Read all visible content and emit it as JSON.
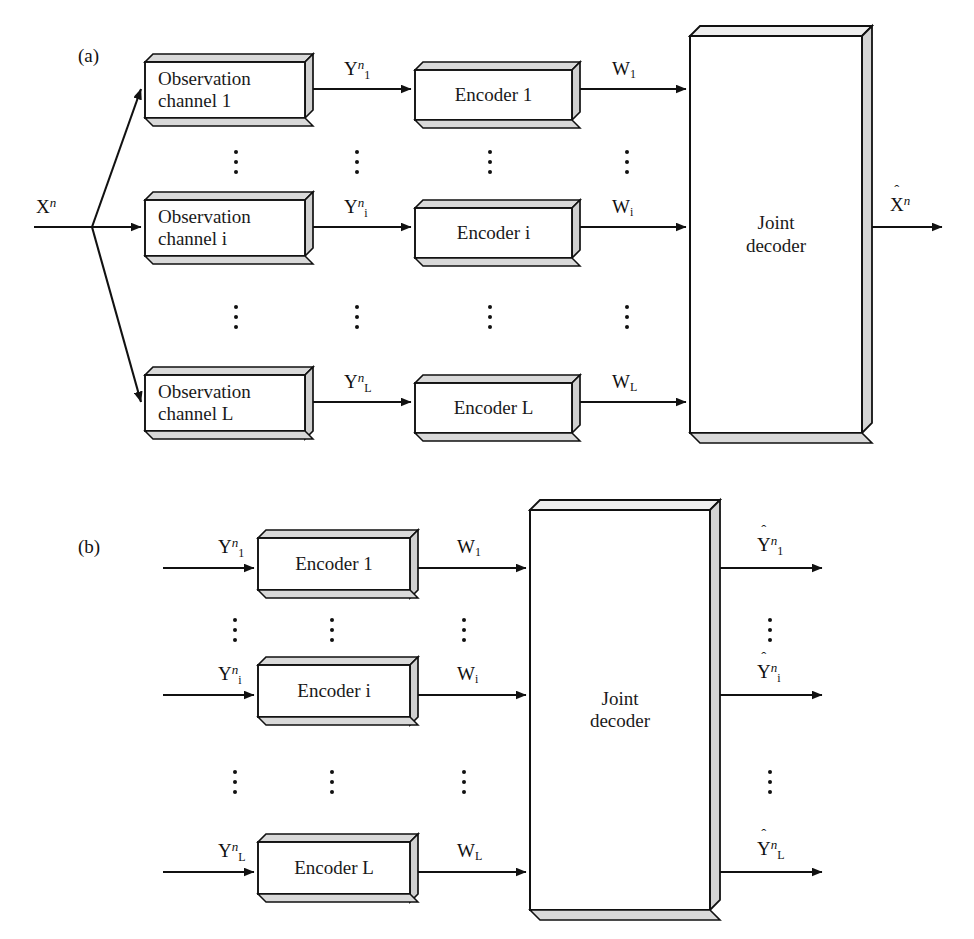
{
  "figure": {
    "background": "#ffffff",
    "line_color": "#111111",
    "box_fill": "#ffffff",
    "box_shadow_fill": "#d9d9d9"
  },
  "panels": [
    {
      "tag": "(a)",
      "input_label": "X",
      "input_sup": "n",
      "blocks_col1": [
        {
          "line1": "Observation",
          "line2": "channel 1"
        },
        {
          "line1": "Observation",
          "line2": "channel i"
        },
        {
          "line1": "Observation",
          "line2": "channel L"
        }
      ],
      "mid_labels": [
        {
          "base": "Y",
          "sub": "1",
          "sup": "n"
        },
        {
          "base": "Y",
          "sub": "i",
          "sup": "n"
        },
        {
          "base": "Y",
          "sub": "L",
          "sup": "n"
        }
      ],
      "blocks_col2": [
        {
          "line1": "Encoder 1"
        },
        {
          "line1": "Encoder i"
        },
        {
          "line1": "Encoder L"
        }
      ],
      "link_labels": [
        {
          "base": "W",
          "sub": "1"
        },
        {
          "base": "W",
          "sub": "i"
        },
        {
          "base": "W",
          "sub": "L"
        }
      ],
      "decoder": {
        "line1": "Joint",
        "line2": "decoder"
      },
      "output_label": {
        "base": "X",
        "sup": "n",
        "hat": "ˆ"
      }
    },
    {
      "tag": "(b)",
      "input_labels": [
        {
          "base": "Y",
          "sub": "1",
          "sup": "n"
        },
        {
          "base": "Y",
          "sub": "i",
          "sup": "n"
        },
        {
          "base": "Y",
          "sub": "L",
          "sup": "n"
        }
      ],
      "blocks": [
        {
          "line1": "Encoder 1"
        },
        {
          "line1": "Encoder i"
        },
        {
          "line1": "Encoder L"
        }
      ],
      "link_labels": [
        {
          "base": "W",
          "sub": "1"
        },
        {
          "base": "W",
          "sub": "i"
        },
        {
          "base": "W",
          "sub": "L"
        }
      ],
      "decoder": {
        "line1": "Joint",
        "line2": "decoder"
      },
      "output_labels": [
        {
          "base": "Y",
          "sub": "1",
          "sup": "n",
          "hat": "ˆ"
        },
        {
          "base": "Y",
          "sub": "i",
          "sup": "n",
          "hat": "ˆ"
        },
        {
          "base": "Y",
          "sub": "L",
          "sup": "n",
          "hat": "ˆ"
        }
      ]
    }
  ],
  "ellipsis_glyph": "⋮"
}
